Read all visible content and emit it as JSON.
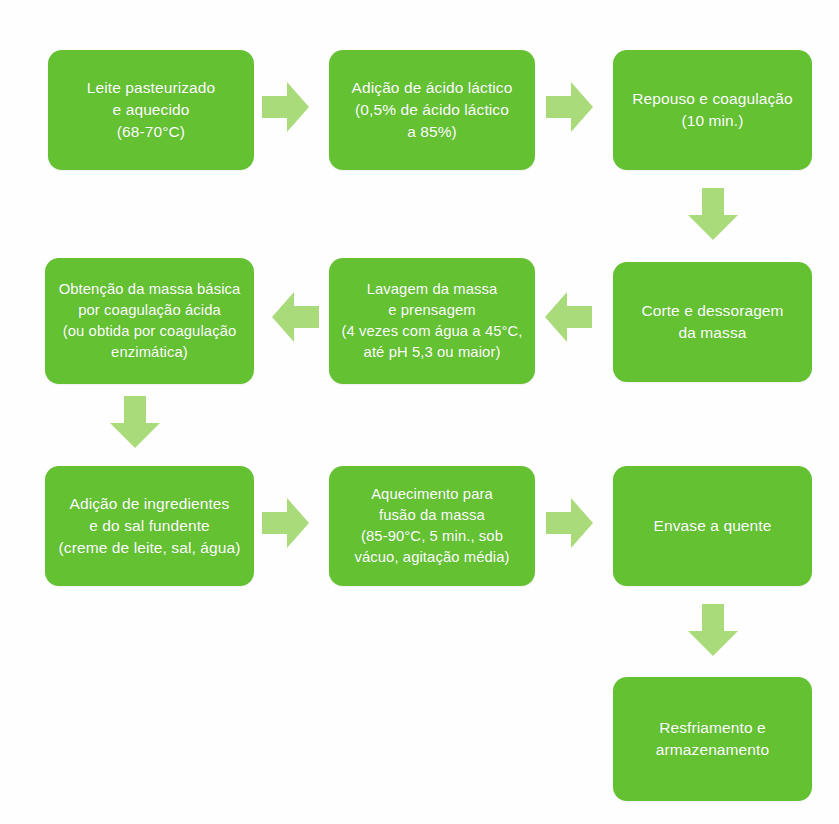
{
  "diagram": {
    "colors": {
      "node_fill": "#63c132",
      "node_text": "#ffffff",
      "arrow_fill": "#a9db7a",
      "background": "#fefefe"
    },
    "nodes": [
      {
        "id": "leite-pasteurizado",
        "text": "Leite pasteurizado\ne aquecido\n(68-70°C)"
      },
      {
        "id": "adicao-acido-lactico",
        "text": "Adição de ácido láctico\n(0,5% de ácido láctico\na 85%)"
      },
      {
        "id": "repouso-coagulacao",
        "text": "Repouso e coagulação\n(10 min.)"
      },
      {
        "id": "corte-dessoragem",
        "text": "Corte e dessoragem\nda massa"
      },
      {
        "id": "lavagem-prensagem",
        "text": "Lavagem da massa\ne prensagem\n(4 vezes com água a 45°C,\naté pH 5,3 ou maior)"
      },
      {
        "id": "obtencao-massa-basica",
        "text": "Obtenção da massa básica\npor coagulação ácida\n(ou obtida por coagulação\nenzimática)"
      },
      {
        "id": "adicao-ingredientes",
        "text": "Adição de ingredientes\ne do sal fundente\n(creme de leite, sal, água)"
      },
      {
        "id": "aquecimento-fusao",
        "text": "Aquecimento para\nfusão da massa\n(85-90°C, 5 min., sob\nvácuo, agitação média)"
      },
      {
        "id": "envase-quente",
        "text": "Envase a quente"
      },
      {
        "id": "resfriamento-armazenamento",
        "text": "Resfriamento e\narmazenamento"
      }
    ],
    "arrows": [
      {
        "id": "arrow-leite-to-acido",
        "direction": "right",
        "icon": "arrow-right-icon"
      },
      {
        "id": "arrow-acido-to-repouso",
        "direction": "right",
        "icon": "arrow-right-icon"
      },
      {
        "id": "arrow-repouso-to-corte",
        "direction": "down",
        "icon": "arrow-down-icon"
      },
      {
        "id": "arrow-corte-to-lavagem",
        "direction": "left",
        "icon": "arrow-left-icon"
      },
      {
        "id": "arrow-lavagem-to-obtencao",
        "direction": "left",
        "icon": "arrow-left-icon"
      },
      {
        "id": "arrow-obtencao-to-adicao",
        "direction": "down",
        "icon": "arrow-down-icon"
      },
      {
        "id": "arrow-adicao-to-aquecimento",
        "direction": "right",
        "icon": "arrow-right-icon"
      },
      {
        "id": "arrow-aquecimento-to-envase",
        "direction": "right",
        "icon": "arrow-right-icon"
      },
      {
        "id": "arrow-envase-to-resfriamento",
        "direction": "down",
        "icon": "arrow-down-icon"
      }
    ]
  }
}
